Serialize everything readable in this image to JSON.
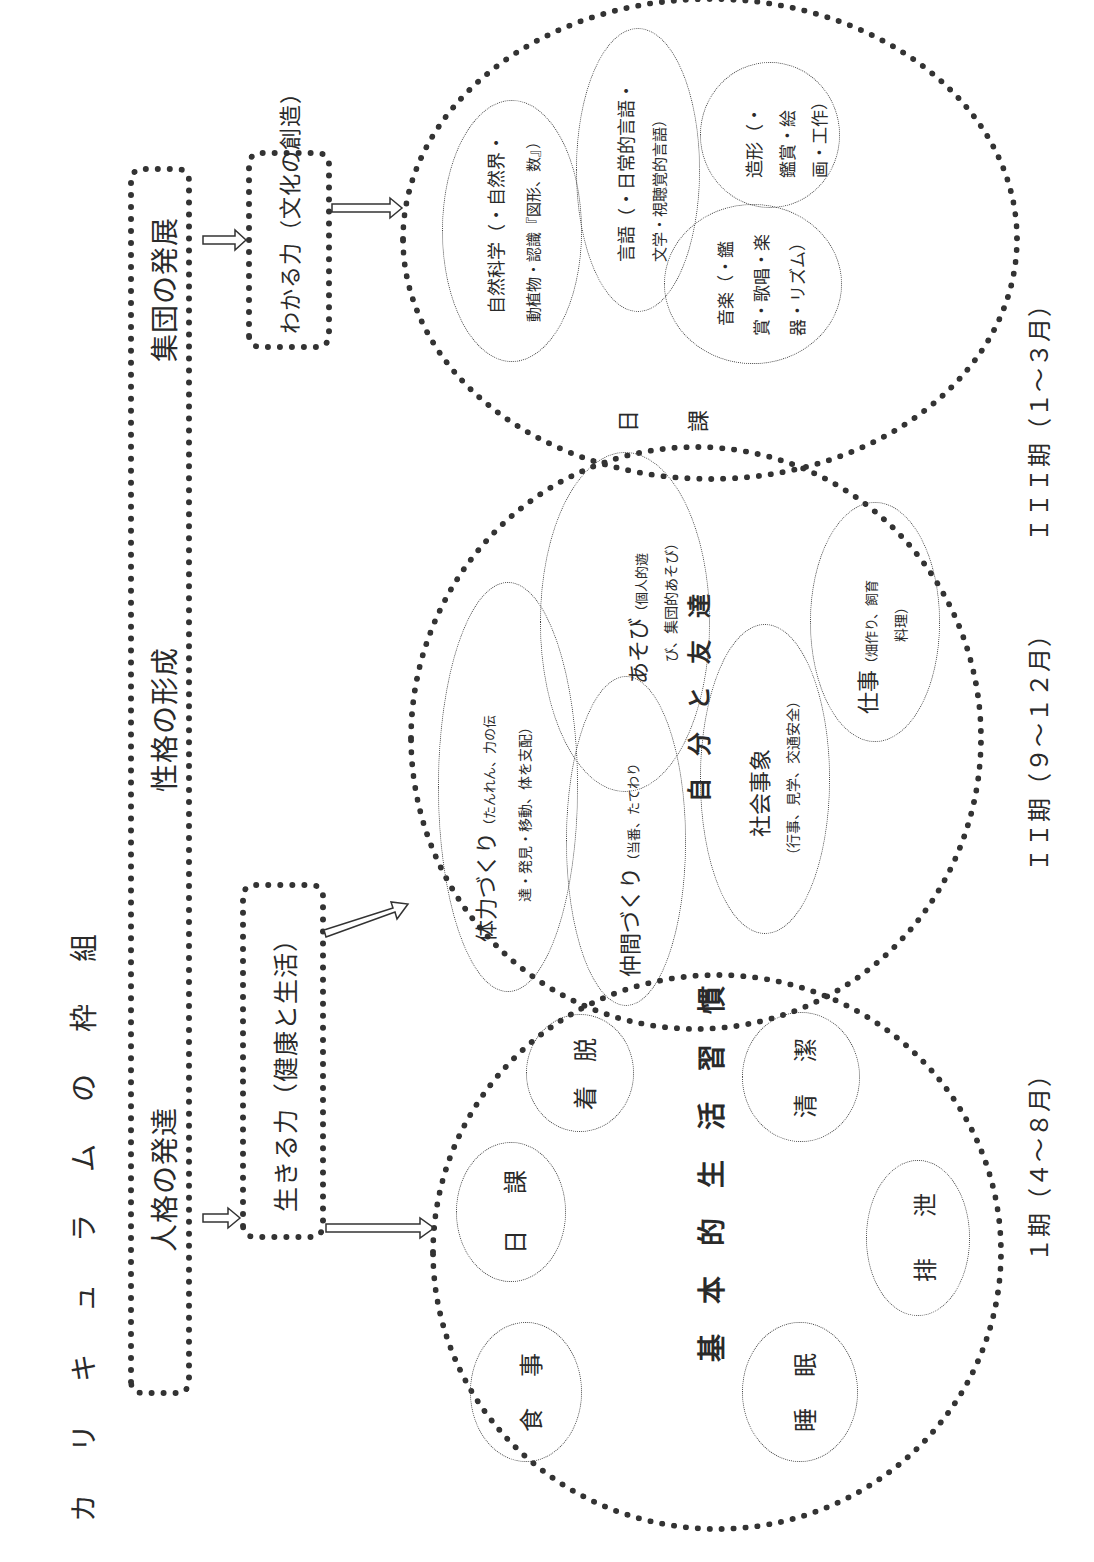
{
  "title_chars": [
    "カ",
    "リ",
    "キ",
    "ュ",
    "ラ",
    "ム",
    "の",
    "枠",
    "組"
  ],
  "development_bar": {
    "items": [
      "人格の発達",
      "性格の形成",
      "集団の発展"
    ]
  },
  "abilities": {
    "living": "生きる力（健康と生活）",
    "understanding": "わかる力（文化の創造）"
  },
  "basic_habits": {
    "center_label_chars": [
      "基",
      "本",
      "的",
      "生",
      "活",
      "習",
      "慣"
    ],
    "items": [
      {
        "label_chars": [
          "食",
          "事"
        ]
      },
      {
        "label_chars": [
          "日",
          "課"
        ]
      },
      {
        "label_chars": [
          "着",
          "脱"
        ]
      },
      {
        "label_chars": [
          "睡",
          "眠"
        ]
      },
      {
        "label_chars": [
          "排",
          "泄"
        ]
      },
      {
        "label_chars": [
          "清",
          "潔"
        ]
      }
    ]
  },
  "self_and_friends": {
    "center_label_chars": [
      "自",
      "分",
      "と",
      "友",
      "達"
    ],
    "items": [
      {
        "title": "仲間づくり",
        "detail": "（当番、たてわり"
      },
      {
        "title": "体力づくり",
        "detail": "（たんれん、力の伝",
        "detail2": "達・発見・移動、体を支配）"
      },
      {
        "title": "あそび",
        "detail": "（個人的遊",
        "detail2": "び、集団的あそび）"
      },
      {
        "title": "社会事象",
        "detail": "（行事、見学、交通安全）"
      },
      {
        "title": "仕事",
        "detail": "（畑作り、飼育",
        "detail2": "料理）"
      }
    ]
  },
  "daily_lessons": {
    "center_label_chars": [
      "日",
      "課"
    ],
    "items": [
      {
        "line1": "自然科学（・自然界・",
        "line2": "動植物・認識『図形、数』）"
      },
      {
        "line1": "言語（・日常的言語・",
        "line2": "文学・視聴覚的言語）"
      },
      {
        "line1": "音楽（・鑑",
        "line2": "賞・歌唱・楽",
        "line3": "器・リズム）"
      },
      {
        "line1": "造形（・",
        "line2": "鑑賞・絵",
        "line3": "画・工作）"
      }
    ]
  },
  "periods": [
    "１期（４～８月）",
    "ＩＩ期（９～１２月）",
    "ＩＩＩ期（１～３月）"
  ]
}
